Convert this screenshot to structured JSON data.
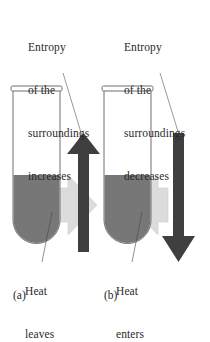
{
  "panels": [
    {
      "id": "a",
      "label": "(a)",
      "entropy_caption": [
        "Entropy",
        "of the",
        "surroundings",
        "increases"
      ],
      "heat_caption": [
        "Heat",
        "leaves"
      ],
      "entropy_direction": "up",
      "heat_direction": "out-of-tube"
    },
    {
      "id": "b",
      "label": "(b)",
      "entropy_caption": [
        "Entropy",
        "of the",
        "surroundings",
        "decreases"
      ],
      "heat_caption": [
        "Heat",
        "enters"
      ],
      "entropy_direction": "down",
      "heat_direction": "into-tube"
    }
  ],
  "colors": {
    "tube_outline": "#6e6e6e",
    "liquid": "#777777",
    "entropy_arrow": "#3f3f3f",
    "heat_arrow": "#dcdcdc",
    "leader_line": "#555555",
    "text": "#2a2a2a"
  }
}
